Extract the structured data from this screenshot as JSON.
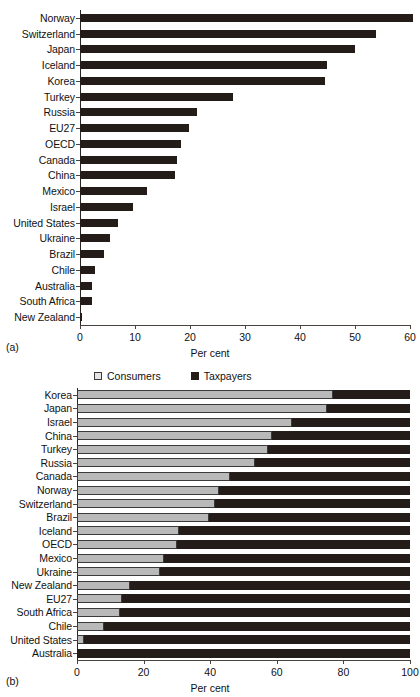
{
  "figure": {
    "panel_a_tag": "(a)",
    "panel_b_tag": "(b)"
  },
  "chart_data": [
    {
      "id": "panel-a",
      "type": "bar",
      "orientation": "horizontal",
      "title": "",
      "xlabel": "Per cent",
      "ylabel": "",
      "xlim": [
        0,
        60
      ],
      "xticks": [
        0,
        10,
        20,
        30,
        40,
        50,
        60
      ],
      "xtick_labels": [
        "0",
        "10",
        "20",
        "30",
        "40",
        "50",
        "60"
      ],
      "grid": false,
      "legend": false,
      "series_color": "#231c18",
      "categories": [
        "Norway",
        "Switzerland",
        "Japan",
        "Iceland",
        "Korea",
        "Turkey",
        "Russia",
        "EU27",
        "OECD",
        "Canada",
        "China",
        "Mexico",
        "Israel",
        "United States",
        "Ukraine",
        "Brazil",
        "Chile",
        "Australia",
        "South Africa",
        "New Zealand"
      ],
      "values": [
        60.5,
        53.8,
        50.0,
        44.9,
        44.5,
        27.9,
        21.3,
        19.8,
        18.3,
        17.7,
        17.3,
        12.1,
        9.7,
        6.9,
        5.4,
        4.3,
        2.8,
        2.1,
        2.1,
        0.4
      ]
    },
    {
      "id": "panel-b",
      "type": "bar",
      "subtype": "stacked-100",
      "orientation": "horizontal",
      "title": "",
      "xlabel": "Per cent",
      "ylabel": "",
      "xlim": [
        0,
        100
      ],
      "xticks": [
        0,
        20,
        40,
        60,
        80,
        100
      ],
      "xtick_labels": [
        "0",
        "20",
        "40",
        "60",
        "80",
        "100"
      ],
      "grid": false,
      "legend": true,
      "legend_position": "top",
      "legend_entries": [
        {
          "label": "Consumers",
          "color": "#e4e4e4",
          "swatch": "open-square"
        },
        {
          "label": "Taxpayers",
          "color": "#231c18",
          "swatch": "filled-square"
        }
      ],
      "categories": [
        "Korea",
        "Japan",
        "Israel",
        "China",
        "Turkey",
        "Russia",
        "Canada",
        "Norway",
        "Switzerland",
        "Brazil",
        "Iceland",
        "OECD",
        "Mexico",
        "Ukraine",
        "New Zealand",
        "EU27",
        "South Africa",
        "Chile",
        "United States",
        "Australia"
      ],
      "series": [
        {
          "name": "Consumers",
          "color": "#b9b9b9",
          "values": [
            77.0,
            75.0,
            64.5,
            58.5,
            57.5,
            53.5,
            46.0,
            42.5,
            41.5,
            39.5,
            30.5,
            30.0,
            26.0,
            25.0,
            16.0,
            13.5,
            13.0,
            8.0,
            2.0,
            0.0
          ]
        },
        {
          "name": "Taxpayers",
          "color": "#231c18",
          "values": [
            23.0,
            25.0,
            35.5,
            41.5,
            42.5,
            46.5,
            54.0,
            57.5,
            58.5,
            60.5,
            69.5,
            70.0,
            74.0,
            75.0,
            84.0,
            86.5,
            87.0,
            92.0,
            98.0,
            100.0
          ]
        }
      ]
    }
  ]
}
